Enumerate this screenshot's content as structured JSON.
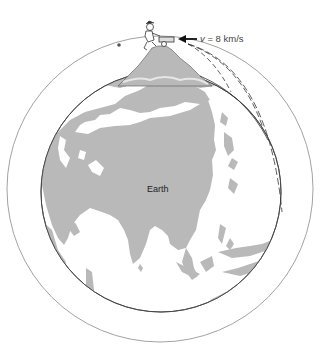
{
  "figure": {
    "earth_label": "Earth",
    "velocity": {
      "symbol": "v",
      "text": " = 8 km/s"
    },
    "colors": {
      "land": "#b8b8b8",
      "ocean": "#ffffff",
      "outline": "#444444",
      "orbit": "#888888",
      "trajectory": "#333333"
    },
    "elements": {
      "earth": "globe centered on Asia",
      "mountain": "tall mountain at north pole with person and cannon",
      "trajectories": 3,
      "orbit": "circular orbit path with starting dot"
    }
  }
}
